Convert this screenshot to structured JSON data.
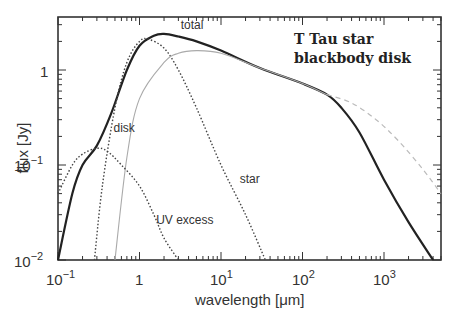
{
  "chart_data": {
    "type": "line",
    "title": "",
    "annotation": [
      "T Tau star",
      "blackbody disk"
    ],
    "xlabel": "wavelength [μm]",
    "ylabel": "flux [Jy]",
    "xscale": "log",
    "yscale": "log",
    "xlim": [
      0.1,
      5000
    ],
    "ylim": [
      0.01,
      3.7
    ],
    "x_ticks": [
      "10^-1",
      "1",
      "10^1",
      "10^2",
      "10^3"
    ],
    "y_ticks": [
      "10^-2",
      "10^-1",
      "1"
    ],
    "grid": false,
    "legend": "none (inline curve labels)",
    "series": [
      {
        "name": "total",
        "style": "solid thick black",
        "x": [
          0.1,
          0.15,
          0.2,
          0.3,
          0.45,
          0.7,
          1.0,
          1.5,
          2.0,
          3.0,
          5.0,
          10,
          30,
          100,
          200,
          300,
          500,
          1000,
          2000,
          4000
        ],
        "y": [
          0.01,
          0.05,
          0.1,
          0.16,
          0.35,
          1.0,
          1.8,
          2.3,
          2.4,
          2.25,
          2.0,
          1.6,
          1.05,
          0.72,
          0.55,
          0.4,
          0.22,
          0.07,
          0.025,
          0.01
        ]
      },
      {
        "name": "disk",
        "style": "dotted black",
        "x": [
          0.28,
          0.35,
          0.5,
          0.7,
          1.0,
          1.3,
          2.0,
          3.0,
          5.0,
          10,
          20,
          35
        ],
        "y": [
          0.01,
          0.06,
          0.4,
          1.2,
          2.0,
          2.1,
          1.7,
          1.0,
          0.4,
          0.1,
          0.03,
          0.01
        ]
      },
      {
        "name": "star",
        "style": "solid thin gray",
        "x": [
          0.5,
          0.7,
          1.0,
          2.0,
          3.0,
          5.0,
          10,
          30,
          100,
          200
        ],
        "y": [
          0.01,
          0.12,
          0.5,
          1.2,
          1.5,
          1.6,
          1.5,
          1.05,
          0.72,
          0.55
        ]
      },
      {
        "name": "UV excess",
        "style": "dotted black",
        "x": [
          0.1,
          0.15,
          0.2,
          0.3,
          0.4,
          0.6,
          1.0,
          1.5,
          2.0,
          3.0
        ],
        "y": [
          0.05,
          0.1,
          0.13,
          0.15,
          0.14,
          0.1,
          0.06,
          0.03,
          0.017,
          0.01
        ]
      },
      {
        "name": "dashed extension",
        "style": "dashed gray",
        "x": [
          200,
          400,
          800,
          1500,
          3000,
          5000
        ],
        "y": [
          0.55,
          0.45,
          0.3,
          0.18,
          0.09,
          0.05
        ]
      }
    ],
    "curve_labels": [
      {
        "text": "total",
        "x": 3.2,
        "y": 2.7
      },
      {
        "text": "disk",
        "x": 0.48,
        "y": 0.22
      },
      {
        "text": "star",
        "x": 17,
        "y": 0.065
      },
      {
        "text": "UV excess",
        "x": 1.6,
        "y": 0.024
      }
    ]
  }
}
